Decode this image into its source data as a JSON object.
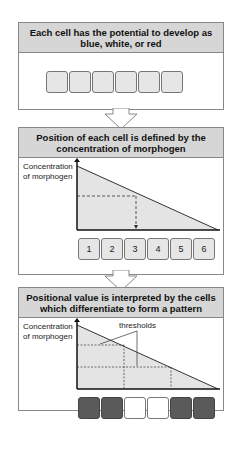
{
  "panel1": {
    "title": "Each cell has the potential to develop as blue, white, or red",
    "cells": [
      "",
      "",
      "",
      "",
      "",
      ""
    ]
  },
  "panel2": {
    "title": "Position of each cell is defined by the concentration of morphogen",
    "ylabel": "Concentration of morphogen",
    "cells": [
      "1",
      "2",
      "3",
      "4",
      "5",
      "6"
    ]
  },
  "panel3": {
    "title": "Positional value is interpreted by the cells which differentiate to form a pattern",
    "ylabel": "Concentration of morphogen",
    "annotation": "thresholds",
    "cells": [
      {
        "color": "dark"
      },
      {
        "color": "dark"
      },
      {
        "color": "white"
      },
      {
        "color": "white"
      },
      {
        "color": "dark"
      },
      {
        "color": "dark"
      }
    ]
  },
  "colors": {
    "header": "#d6d6d6",
    "cell_light": "#e6e6e6",
    "cell_dark": "#5a5a5a",
    "gradient_fill": "#e4e4e4"
  }
}
